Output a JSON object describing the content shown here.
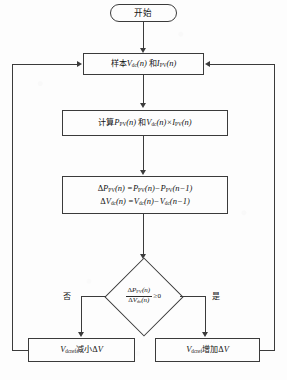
{
  "diagram": {
    "type": "flowchart",
    "nodes": {
      "start": {
        "shape": "terminator",
        "label": "开始"
      },
      "sample": {
        "shape": "process",
        "label": "样本Vdc(n) 和IPV(n)",
        "parts": {
          "prefix": "样本",
          "var1": "V",
          "var1_sub": "dc",
          "arg1": "(n)",
          "conj": "和",
          "var2": "I",
          "var2_sub": "PV",
          "arg2": "(n)"
        }
      },
      "compute": {
        "shape": "process",
        "label": "计算PPV(n) 和Vdc(n)×IPV(n)",
        "parts": {
          "prefix": "计算",
          "var1": "P",
          "var1_sub": "PV",
          "arg1": "(n)",
          "conj": "和",
          "var2": "V",
          "var2_sub": "dc",
          "arg2": "(n)",
          "times": "×",
          "var3": "I",
          "var3_sub": "PV",
          "arg3": "(n)"
        }
      },
      "delta": {
        "shape": "process",
        "line1": "ΔPPV(n) = PPV(n) − PPV(n−1)",
        "line2": "ΔVdc(n) = Vdc(n) − Vdc(n−1)",
        "parts": {
          "delta": "Δ",
          "p": "P",
          "p_sub": "PV",
          "v": "V",
          "v_sub": "dc",
          "arg_n": "(n)",
          "eq": "=",
          "minus": "−",
          "arg_n1": "(n−1)"
        }
      },
      "decision": {
        "shape": "decision",
        "label": "ΔPPV(n) / ΔVdc(n) ≥ 0",
        "parts": {
          "numerator_delta": "Δ",
          "numerator_var": "P",
          "numerator_sub": "PV",
          "numerator_arg": "(n)",
          "denominator_delta": "Δ",
          "denominator_var": "V",
          "denominator_sub": "dc",
          "denominator_arg": "(n)",
          "comparator": "≥0"
        }
      },
      "decrease": {
        "shape": "process",
        "label": "Vdcref减小ΔV",
        "parts": {
          "var": "V",
          "var_sub": "dcref",
          "action": "减小",
          "delta": "Δ",
          "delta_var": "V"
        }
      },
      "increase": {
        "shape": "process",
        "label": "Vdcref增加ΔV",
        "parts": {
          "var": "V",
          "var_sub": "dcref",
          "action": "增加",
          "delta": "Δ",
          "delta_var": "V"
        }
      }
    },
    "branch_labels": {
      "no": "否",
      "yes": "是"
    },
    "colors": {
      "stroke": "#3b3b3b",
      "text": "#131313",
      "background": "#fdfdfd"
    }
  }
}
